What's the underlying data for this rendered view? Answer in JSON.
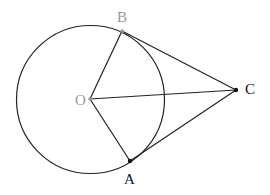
{
  "diagram": {
    "type": "geometry",
    "circle": {
      "center": "O",
      "cx": 90.5,
      "cy": 99.5,
      "r": 74,
      "stroke": "#222222"
    },
    "points": [
      {
        "name": "O",
        "label": "O",
        "x": 90,
        "y": 99,
        "color": "#999999",
        "label_x": 75,
        "label_y": 105
      },
      {
        "name": "B",
        "label": "B",
        "x": 122,
        "y": 31,
        "color": "#999999",
        "label_x": 117,
        "label_y": 22
      },
      {
        "name": "A",
        "label": "A",
        "x": 130,
        "y": 161,
        "color": "#111111",
        "label_x": 124,
        "label_y": 184
      },
      {
        "name": "C",
        "label": "C",
        "x": 236,
        "y": 90,
        "color": "#111111",
        "label_x": 245,
        "label_y": 94
      }
    ],
    "segments": [
      [
        "O",
        "B"
      ],
      [
        "O",
        "A"
      ],
      [
        "O",
        "C"
      ],
      [
        "B",
        "C"
      ],
      [
        "A",
        "C"
      ]
    ]
  }
}
